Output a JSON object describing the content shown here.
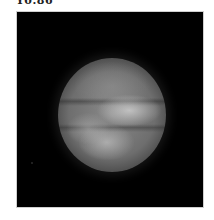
{
  "figure": {
    "caption": "Y0.86",
    "panel_background": "#000000",
    "panel_border": "#cfcfcf"
  }
}
